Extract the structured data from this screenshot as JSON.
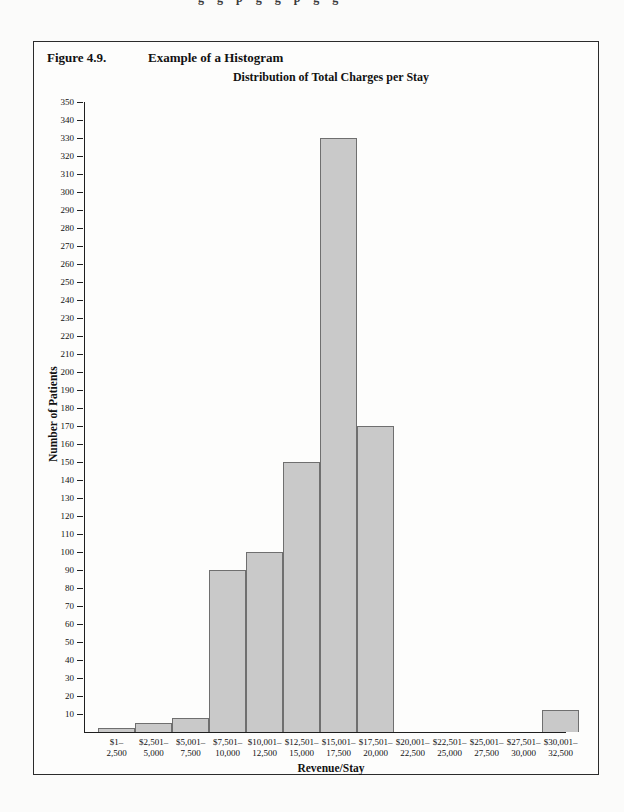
{
  "page": {
    "top_cropped_text": "g g p g   g p   g g"
  },
  "figure": {
    "label": "Figure 4.9.",
    "title": "Example of a Histogram"
  },
  "chart_data": {
    "type": "bar",
    "title": "Distribution of Total Charges per Stay",
    "xlabel": "Revenue/Stay",
    "ylabel": "Number of Patients",
    "ylim": [
      0,
      350
    ],
    "ytick_step": 10,
    "grid": false,
    "legend": "none",
    "bar_fill": "#c9c9c9",
    "bar_border": "#6f6f6f",
    "categories": [
      "$1–2,500",
      "$2,501–5,000",
      "$5,001–7,500",
      "$7,501–10,000",
      "$10,001–12,500",
      "$12,501–15,000",
      "$15,001–17,500",
      "$17,501–20,000",
      "$20,001–22,500",
      "$22,501–25,000",
      "$25,001–27,500",
      "$27,501–30,000",
      "$30,001–32,500"
    ],
    "category_labels_2line": [
      [
        "$1–",
        "2,500"
      ],
      [
        "$2,501–",
        "5,000"
      ],
      [
        "$5,001–",
        "7,500"
      ],
      [
        "$7,501–",
        "10,000"
      ],
      [
        "$10,001–",
        "12,500"
      ],
      [
        "$12,501–",
        "15,000"
      ],
      [
        "$15,001–",
        "17,500"
      ],
      [
        "$17,501–",
        "20,000"
      ],
      [
        "$20,001–",
        "22,500"
      ],
      [
        "$22,501–",
        "25,000"
      ],
      [
        "$25,001–",
        "27,500"
      ],
      [
        "$27,501–",
        "30,000"
      ],
      [
        "$30,001–",
        "32,500"
      ]
    ],
    "values": [
      2,
      5,
      8,
      90,
      100,
      150,
      330,
      170,
      0,
      0,
      0,
      0,
      12
    ]
  }
}
